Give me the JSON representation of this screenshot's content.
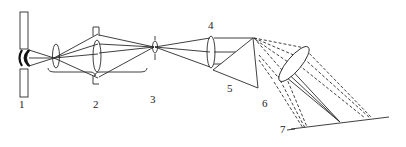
{
  "diagram": {
    "type": "optical-schematic",
    "line_color": "#2a2a2a",
    "labels": [
      {
        "id": "1",
        "text": "1",
        "x": 19,
        "y": 108
      },
      {
        "id": "2",
        "text": "2",
        "x": 93,
        "y": 108
      },
      {
        "id": "3",
        "text": "3",
        "x": 150,
        "y": 103
      },
      {
        "id": "4",
        "text": "4",
        "x": 208,
        "y": 29
      },
      {
        "id": "5",
        "text": "5",
        "x": 227,
        "y": 92
      },
      {
        "id": "6",
        "text": "6",
        "x": 262,
        "y": 107
      },
      {
        "id": "7",
        "text": "7",
        "x": 280,
        "y": 133
      }
    ]
  }
}
